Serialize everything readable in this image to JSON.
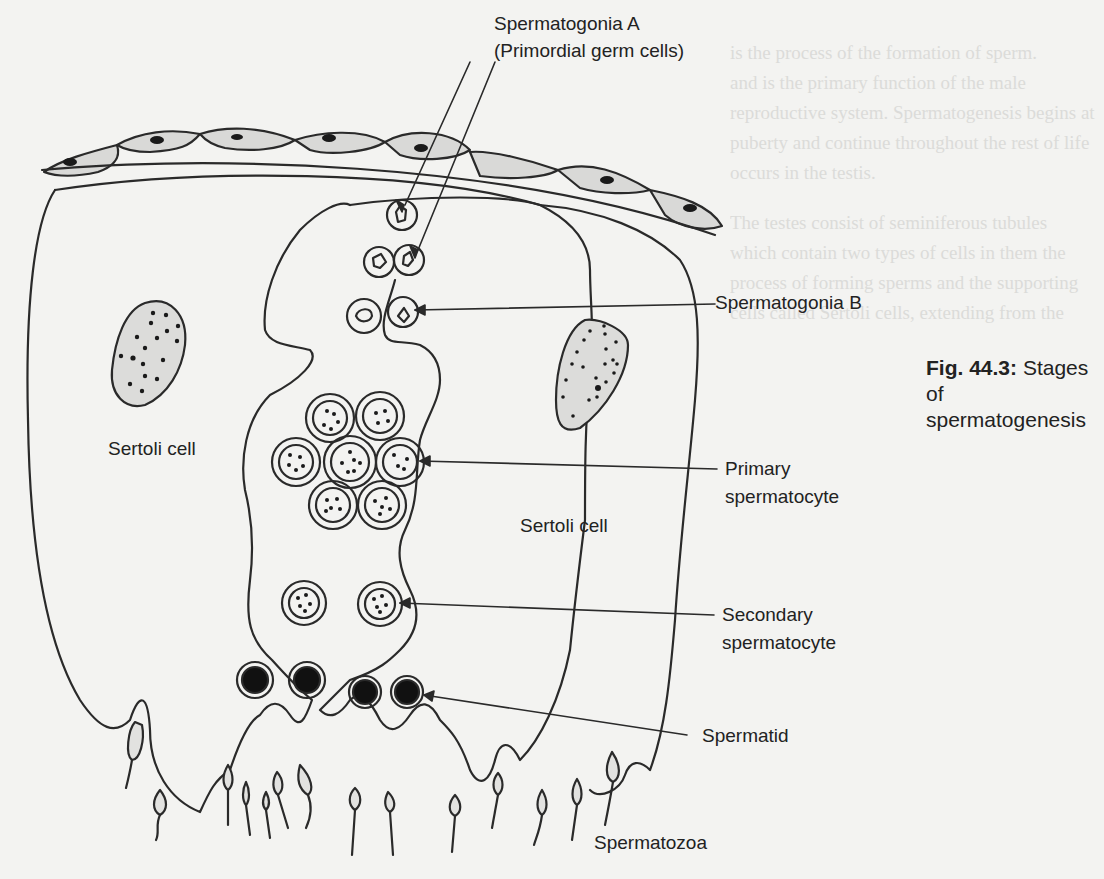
{
  "figure": {
    "number": "Fig. 44.3:",
    "title_line1": "Stages of",
    "title_line2": "spermatogenesis"
  },
  "labels": {
    "spermatogonia_a": "Spermatogonia A",
    "primordial": "(Primordial germ cells)",
    "spermatogonia_b": "Spermatogonia B",
    "sertoli_left": "Sertoli cell",
    "sertoli_center": "Sertoli cell",
    "primary_1": "Primary",
    "primary_2": "spermatocyte",
    "secondary_1": "Secondary",
    "secondary_2": "spermatocyte",
    "spermatid": "Spermatid",
    "spermatozoa": "Spermatozoa"
  },
  "bleed_through_text": [
    "is the process of the formation of sperm.",
    "and is the primary function of the male",
    "reproductive system. Spermatogenesis begins at",
    "puberty and continue throughout the rest of life",
    "occurs in the testis.",
    "The testes consist of seminiferous tubules",
    "which contain two types of cells in them the",
    "process of forming sperms and the supporting",
    "cells called Sertoli cells, extending from the"
  ],
  "colors": {
    "ink": "#2a2a2a",
    "cell_fill": "#d9d9d7",
    "paper": "#f3f3f1"
  }
}
